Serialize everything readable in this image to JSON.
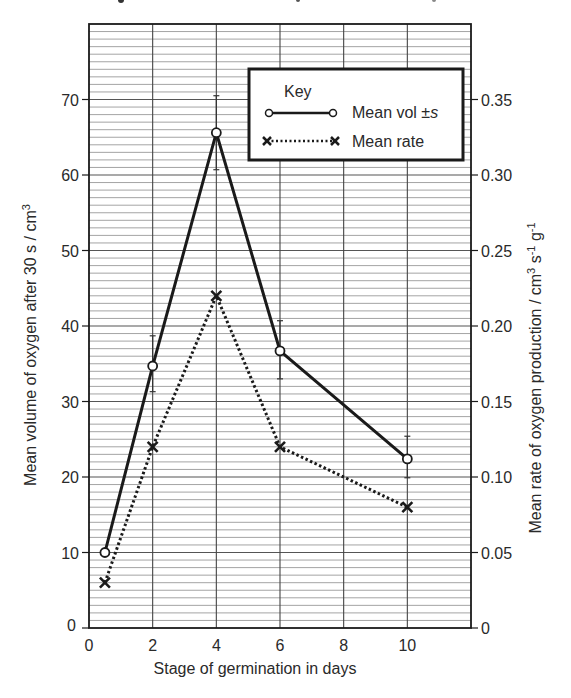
{
  "chart_data": {
    "type": "line",
    "title": "",
    "xlabel": "Stage of germination in days",
    "ylabel": "Mean volume of oxygen after 30 s / cm³",
    "ylabel_right": "Mean rate of oxygen production / cm³ s⁻¹ g⁻¹",
    "xlim": [
      0,
      12
    ],
    "ylim": [
      0,
      80
    ],
    "ylim_right": [
      0,
      0.4
    ],
    "grid": true,
    "x_ticks": [
      "0",
      "2",
      "4",
      "6",
      "8",
      "10"
    ],
    "y_ticks": [
      "0",
      "10",
      "20",
      "30",
      "40",
      "50",
      "60",
      "70"
    ],
    "y_ticks_right": [
      "0",
      "0.05",
      "0.10",
      "0.15",
      "0.20",
      "0.25",
      "0.30",
      "0.35"
    ],
    "legend": {
      "title": "Key",
      "position": "upper right",
      "entries": [
        "Mean vol ±s",
        "Mean rate"
      ]
    },
    "series": [
      {
        "name": "Mean vol ±s",
        "axis": "left",
        "style": "solid line, open circle markers, error bars",
        "x": [
          0.5,
          2,
          4,
          6,
          10
        ],
        "values": [
          10,
          34.7,
          65.6,
          36.7,
          22.4
        ],
        "error_low": [
          9.5,
          31.3,
          60.7,
          33.0,
          19.9
        ],
        "error_high": [
          10.5,
          38.7,
          70.5,
          40.7,
          25.4
        ]
      },
      {
        "name": "Mean rate",
        "axis": "right",
        "style": "dotted line, cross markers",
        "x": [
          0.5,
          2,
          4,
          6,
          10
        ],
        "values": [
          0.03,
          0.12,
          0.22,
          0.12,
          0.08
        ]
      }
    ]
  },
  "labels": {
    "x_axis": "Stage of germination in days",
    "y_axis_left": "Mean volume of oxygen after 30 s / cm",
    "y_axis_left_sup": "3",
    "y_axis_right_a": "Mean rate of oxygen production / cm",
    "y_axis_right_sup1": "3",
    "y_axis_right_b": " s",
    "y_axis_right_sup2": "-1",
    "y_axis_right_c": " g",
    "y_axis_right_sup3": "-1",
    "key_title": "Key",
    "key_vol": "Mean vol ±",
    "key_vol_s": "s",
    "key_rate": "Mean rate",
    "x0_label": "0",
    "y0_label": "0"
  }
}
